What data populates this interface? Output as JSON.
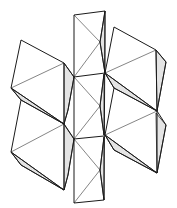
{
  "diagram": {
    "type": "polyhedron-net",
    "colors": {
      "line": "#1a1a1a",
      "shade": "#e4e4e4",
      "background": "#ffffff"
    },
    "shaded_faces": [
      [
        [
          64,
          63
        ],
        [
          74,
          77
        ],
        [
          68,
          110
        ],
        [
          64,
          124
        ]
      ],
      [
        [
          11,
          88
        ],
        [
          21,
          100
        ],
        [
          64,
          124
        ]
      ],
      [
        [
          64,
          124
        ],
        [
          74,
          139
        ],
        [
          68,
          175
        ],
        [
          64,
          190
        ]
      ],
      [
        [
          11,
          152
        ],
        [
          21,
          165
        ],
        [
          64,
          190
        ]
      ],
      [
        [
          105,
          73
        ],
        [
          114,
          88
        ],
        [
          157,
          111
        ]
      ],
      [
        [
          156,
          50
        ],
        [
          166,
          62
        ],
        [
          157,
          111
        ]
      ],
      [
        [
          105,
          135
        ],
        [
          114,
          150
        ],
        [
          157,
          173
        ]
      ],
      [
        [
          156,
          113
        ],
        [
          166,
          125
        ],
        [
          157,
          173
        ]
      ],
      [
        [
          100,
          42
        ],
        [
          105,
          11
        ],
        [
          105,
          73
        ]
      ],
      [
        [
          100,
          106
        ],
        [
          104,
          74
        ],
        [
          104,
          135
        ]
      ],
      [
        [
          100,
          170
        ],
        [
          104,
          137
        ],
        [
          104,
          200
        ]
      ]
    ],
    "outline_edges": [
      [
        [
          74,
          15
        ],
        [
          105,
          11
        ]
      ],
      [
        [
          74,
          15
        ],
        [
          74,
          203
        ]
      ],
      [
        [
          105,
          11
        ],
        [
          104,
          200
        ]
      ],
      [
        [
          74,
          203
        ],
        [
          104,
          200
        ]
      ],
      [
        [
          74,
          77
        ],
        [
          105,
          73
        ]
      ],
      [
        [
          74,
          139
        ],
        [
          104,
          136
        ]
      ],
      [
        [
          21,
          40
        ],
        [
          64,
          63
        ]
      ],
      [
        [
          21,
          40
        ],
        [
          11,
          88
        ]
      ],
      [
        [
          64,
          63
        ],
        [
          74,
          77
        ]
      ],
      [
        [
          11,
          88
        ],
        [
          64,
          124
        ]
      ],
      [
        [
          64,
          63
        ],
        [
          64,
          124
        ]
      ],
      [
        [
          11,
          88
        ],
        [
          21,
          100
        ]
      ],
      [
        [
          21,
          100
        ],
        [
          64,
          124
        ]
      ],
      [
        [
          64,
          124
        ],
        [
          74,
          139
        ]
      ],
      [
        [
          21,
          100
        ],
        [
          11,
          152
        ]
      ],
      [
        [
          11,
          152
        ],
        [
          64,
          190
        ]
      ],
      [
        [
          64,
          124
        ],
        [
          64,
          190
        ]
      ],
      [
        [
          11,
          152
        ],
        [
          21,
          165
        ]
      ],
      [
        [
          21,
          165
        ],
        [
          64,
          190
        ]
      ],
      [
        [
          74,
          77
        ],
        [
          68,
          110
        ]
      ],
      [
        [
          68,
          110
        ],
        [
          64,
          124
        ]
      ],
      [
        [
          74,
          139
        ],
        [
          68,
          175
        ]
      ],
      [
        [
          68,
          175
        ],
        [
          64,
          190
        ]
      ],
      [
        [
          114,
          27
        ],
        [
          156,
          50
        ]
      ],
      [
        [
          114,
          27
        ],
        [
          105,
          73
        ]
      ],
      [
        [
          156,
          50
        ],
        [
          166,
          62
        ]
      ],
      [
        [
          166,
          62
        ],
        [
          157,
          111
        ]
      ],
      [
        [
          156,
          50
        ],
        [
          157,
          111
        ]
      ],
      [
        [
          105,
          73
        ],
        [
          114,
          88
        ]
      ],
      [
        [
          114,
          88
        ],
        [
          157,
          111
        ]
      ],
      [
        [
          105,
          73
        ],
        [
          157,
          111
        ]
      ],
      [
        [
          114,
          88
        ],
        [
          105,
          135
        ]
      ],
      [
        [
          157,
          111
        ],
        [
          166,
          125
        ]
      ],
      [
        [
          166,
          125
        ],
        [
          157,
          173
        ]
      ],
      [
        [
          157,
          111
        ],
        [
          157,
          173
        ]
      ],
      [
        [
          105,
          135
        ],
        [
          114,
          150
        ]
      ],
      [
        [
          114,
          150
        ],
        [
          157,
          173
        ]
      ],
      [
        [
          105,
          135
        ],
        [
          157,
          173
        ]
      ],
      [
        [
          100,
          42
        ],
        [
          105,
          11
        ]
      ],
      [
        [
          100,
          42
        ],
        [
          105,
          73
        ]
      ],
      [
        [
          100,
          106
        ],
        [
          104,
          74
        ]
      ],
      [
        [
          100,
          106
        ],
        [
          104,
          135
        ]
      ],
      [
        [
          100,
          170
        ],
        [
          104,
          137
        ]
      ],
      [
        [
          100,
          170
        ],
        [
          104,
          200
        ]
      ]
    ],
    "fold_lines": [
      [
        [
          11,
          88
        ],
        [
          64,
          63
        ]
      ],
      [
        [
          11,
          152
        ],
        [
          64,
          124
        ]
      ],
      [
        [
          105,
          73
        ],
        [
          156,
          50
        ]
      ],
      [
        [
          105,
          135
        ],
        [
          157,
          111
        ]
      ],
      [
        [
          74,
          15
        ],
        [
          100,
          42
        ]
      ],
      [
        [
          74,
          77
        ],
        [
          100,
          42
        ]
      ],
      [
        [
          74,
          77
        ],
        [
          100,
          106
        ]
      ],
      [
        [
          74,
          139
        ],
        [
          100,
          106
        ]
      ],
      [
        [
          74,
          139
        ],
        [
          100,
          170
        ]
      ],
      [
        [
          74,
          203
        ],
        [
          100,
          170
        ]
      ]
    ]
  }
}
